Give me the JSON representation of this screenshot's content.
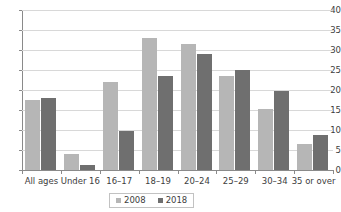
{
  "chart_data": {
    "type": "bar",
    "title": "",
    "subtitle": "",
    "xlabel": "",
    "ylabel": "",
    "ylim": [
      0,
      40
    ],
    "yticks": [
      0,
      5,
      10,
      15,
      20,
      25,
      30,
      35,
      40
    ],
    "grid": true,
    "legend_position": "bottom",
    "categories": [
      "All ages",
      "Under 16",
      "16–17",
      "18–19",
      "20–24",
      "25–29",
      "30–34",
      "35 or over"
    ],
    "series": [
      {
        "name": "2008",
        "color": "#b6b6b6",
        "values": [
          17.5,
          4.1,
          22.0,
          33.0,
          31.4,
          23.6,
          15.2,
          6.4
        ]
      },
      {
        "name": "2018",
        "color": "#6f6f6f",
        "values": [
          18.0,
          1.2,
          9.8,
          23.4,
          29.0,
          25.1,
          19.7,
          8.8
        ]
      }
    ]
  },
  "legend": {
    "entries": [
      {
        "label": "2008",
        "color": "#b6b6b6"
      },
      {
        "label": "2018",
        "color": "#6f6f6f"
      }
    ]
  },
  "colors": {
    "series_2008": "#b6b6b6",
    "series_2018": "#6f6f6f",
    "gridline": "#d8d8d8",
    "axis": "#8a8a8a",
    "text": "#3d3d3d",
    "background": "#ffffff"
  }
}
